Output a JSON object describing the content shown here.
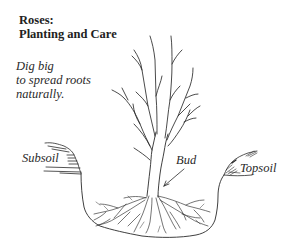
{
  "title": {
    "line1": "Roses:",
    "line2": "Planting and Care"
  },
  "caption": {
    "line1": "Dig big",
    "line2": "to spread roots",
    "line3": "naturally."
  },
  "labels": {
    "subsoil": "Subsoil",
    "bud": "Bud",
    "topsoil": "Topsoil"
  },
  "illustration": {
    "subject": "rose bush planted in a wide hole with spreading roots",
    "style": "pen-and-ink line drawing",
    "ink_color": "#2a2a2a",
    "background_color": "#ffffff"
  }
}
